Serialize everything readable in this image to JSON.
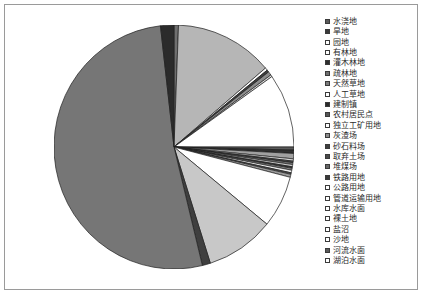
{
  "chart_data": {
    "type": "pie",
    "title": "",
    "legend_position": "right",
    "grid": false,
    "categories": [
      "水浇地",
      "旱地",
      "园地",
      "有林地",
      "灌木林地",
      "疏林地",
      "天然草地",
      "人工草地",
      "建制镇",
      "农村居民点",
      "独立工矿用地",
      "灰渣场",
      "砂石料场",
      "取弃土场",
      "堆煤场",
      "铁路用地",
      "公路用地",
      "管道运输用地",
      "水库水面",
      "裸土地",
      "盐沼",
      "沙地",
      "河流水面",
      "湖泊水面"
    ],
    "values": [
      0.6,
      13.2,
      0.35,
      0.3,
      0.5,
      0.25,
      9.8,
      0.4,
      0.45,
      0.7,
      0.3,
      0.2,
      0.25,
      0.3,
      0.2,
      0.25,
      0.35,
      0.2,
      0.4,
      6.9,
      9.2,
      1.1,
      52.0,
      1.8
    ],
    "colors": [
      "#6f6f6f",
      "#b6b6b6",
      "#ffffff",
      "#3f3f3f",
      "#8d8d8d",
      "#e2e2e2",
      "#ffffff",
      "#5a5a5a",
      "#2f2f2f",
      "#a0a0a0",
      "#d6d6d6",
      "#4a4a4a",
      "#7b7b7b",
      "#c4c4c4",
      "#383838",
      "#8d8d8d",
      "#ededed",
      "#555555",
      "#9a9a9a",
      "#ffffff",
      "#c8c8c8",
      "#3f3f3f",
      "#767676",
      "#2b2b2b"
    ],
    "swatch_fills": [
      "#5a5a5a",
      "#3a3a3a",
      "#ffffff",
      "#ffffff",
      "#2f2f2f",
      "#6f6f6f",
      "#7b7b7b",
      "#ffffff",
      "#2b2b2b",
      "#555555",
      "#ffffff",
      "#8d8d8d",
      "#3f3f3f",
      "#4a4a4a",
      "#666666",
      "#3a3a3a",
      "#ffffff",
      "#ffffff",
      "#ffffff",
      "#ffffff",
      "#ffffff",
      "#ffffff",
      "#5a5a5a",
      "#ffffff"
    ],
    "start_angle_deg": -90,
    "direction": "clockwise"
  },
  "frame": {
    "border_color": "#9a9a9a",
    "background": "#ffffff"
  }
}
